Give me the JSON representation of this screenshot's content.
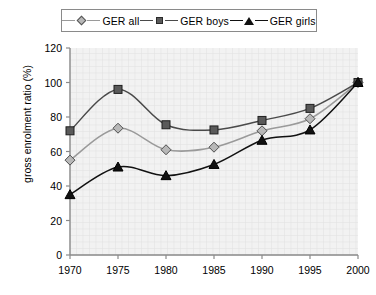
{
  "chart_data": {
    "type": "line",
    "title": "",
    "xlabel": "",
    "ylabel": "gross enrolment ratio (%)",
    "categories": [
      "1970",
      "1975",
      "1980",
      "1985",
      "1990",
      "1995",
      "2000"
    ],
    "x": [
      1970,
      1975,
      1980,
      1985,
      1990,
      1995,
      2000
    ],
    "xlim": [
      1970,
      2000
    ],
    "ylim": [
      0,
      120
    ],
    "yticks": [
      0,
      20,
      40,
      60,
      80,
      100,
      120
    ],
    "grid": true,
    "legend_position": "top",
    "series": [
      {
        "name": "GER all",
        "marker": "diamond",
        "color": "#9a9a9a",
        "marker_fill": "#b8b8b8",
        "values": [
          55,
          73.5,
          61,
          62.5,
          72,
          79,
          100
        ]
      },
      {
        "name": "GER boys",
        "marker": "square",
        "color": "#4a4a4a",
        "marker_fill": "#5a5a5a",
        "values": [
          72,
          96,
          75.5,
          72.5,
          78,
          85,
          100
        ]
      },
      {
        "name": "GER girls",
        "marker": "triangle",
        "color": "#111111",
        "marker_fill": "#111111",
        "values": [
          35,
          51,
          46,
          52.5,
          66.5,
          72.5,
          100
        ]
      }
    ]
  },
  "legend": {
    "entries": [
      {
        "label": "GER all"
      },
      {
        "label": "GER boys"
      },
      {
        "label": "GER girls"
      }
    ]
  },
  "colors": {
    "plot_background": "#f2f2f2",
    "grid": "#e2e2e2",
    "axis": "#8a8a8a",
    "series_all": "#9a9a9a",
    "series_boys": "#4a4a4a",
    "series_girls": "#111111"
  }
}
